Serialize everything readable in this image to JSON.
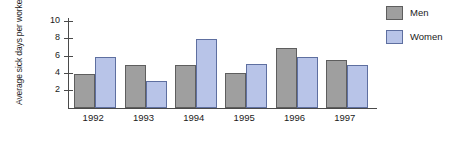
{
  "chart_data": {
    "type": "bar",
    "title": "",
    "subtitle": "",
    "xlabel": "",
    "ylabel": "Average sick days per worker",
    "ylabel_lines": [
      "Average",
      "sick days",
      "per worker"
    ],
    "categories": [
      "1992",
      "1993",
      "1994",
      "1995",
      "1996",
      "1997"
    ],
    "series": [
      {
        "name": "Men",
        "color": "#9f9f9f",
        "values": [
          4,
          5,
          5,
          4.1,
          7,
          5.6
        ]
      },
      {
        "name": "Women",
        "color": "#b8c4e8",
        "values": [
          6,
          3.2,
          8.1,
          5.1,
          6,
          5
        ]
      }
    ],
    "ylim": [
      0,
      10.5
    ],
    "yticks": [
      2,
      4,
      6,
      8,
      10
    ],
    "ytick_labels": [
      "2",
      "4",
      "6",
      "8",
      "10"
    ],
    "grid": false,
    "legend_position": "right-top",
    "legend_entries": [
      "Men",
      "Women"
    ],
    "annotations": []
  },
  "colors": {
    "men_fill": "#9f9f9f",
    "men_stroke": "#5e5e5e",
    "women_fill": "#b8c4e8",
    "women_stroke": "#5e6fa0",
    "axis": "#4a4a4a",
    "background": "#ffffff",
    "text": "#1a1a1a"
  }
}
